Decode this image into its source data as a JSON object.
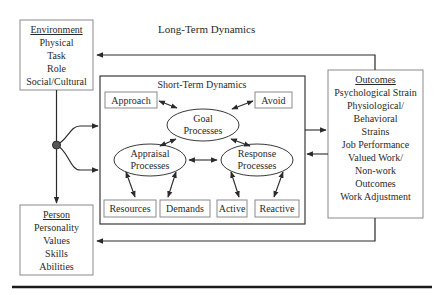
{
  "diagram": {
    "long_term_label": "Long-Term Dynamics",
    "short_term_label": "Short-Term Dynamics",
    "environment": {
      "title": "Environment",
      "items": [
        "Physical",
        "Task",
        "Role",
        "Social/Cultural"
      ]
    },
    "person": {
      "title": "Person",
      "items": [
        "Personality",
        "Values",
        "Skills",
        "Abilities"
      ]
    },
    "outcomes": {
      "title": "Outcomes",
      "items": [
        "Psychological Strain",
        "Physiological/",
        "Behavioral",
        "Strains",
        "Job Performance",
        "Valued Work/",
        "Non-work",
        "Outcomes",
        "Work Adjustment"
      ]
    },
    "processes": {
      "goal": [
        "Goal",
        "Processes"
      ],
      "appraisal": [
        "Appraisal",
        "Processes"
      ],
      "response": [
        "Response",
        "Processes"
      ]
    },
    "leaf_boxes": {
      "approach": "Approach",
      "avoid": "Avoid",
      "resources": "Resources",
      "demands": "Demands",
      "active": "Active",
      "reactive": "Reactive"
    },
    "colors": {
      "stroke": "#3a3a3a",
      "box_stroke": "#8a8a8a",
      "node_fill": "#555555",
      "rule": "#1a1a1a"
    }
  }
}
